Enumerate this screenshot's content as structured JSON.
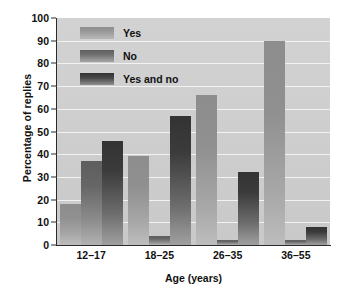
{
  "chart_data": {
    "type": "bar",
    "title": "",
    "xlabel": "Age (years)",
    "ylabel": "Percentage of replies",
    "categories": [
      "12–17",
      "18–25",
      "26–35",
      "36–55"
    ],
    "series": [
      {
        "name": "Yes",
        "values": [
          18,
          39,
          66,
          90
        ]
      },
      {
        "name": "No",
        "values": [
          37,
          4,
          2,
          2
        ]
      },
      {
        "name": "Yes and no",
        "values": [
          46,
          57,
          32,
          8
        ]
      }
    ],
    "ylim": [
      0,
      100
    ],
    "yticks": [
      0,
      10,
      20,
      30,
      40,
      50,
      60,
      70,
      80,
      90,
      100
    ],
    "ytick_labels": [
      "0",
      "10",
      "20",
      "30",
      "40",
      "50",
      "60",
      "70",
      "80",
      "90",
      "100"
    ],
    "grid": true,
    "grid_axis": "y",
    "legend_position": "upper-left-inside",
    "plot_background": "#cfcfcf",
    "grid_color": "#f2f2f2",
    "axis_color": "#2b2b2b",
    "series_colors": [
      "#9a9a9a",
      "#6b6b6b",
      "#3a3a3a"
    ]
  }
}
